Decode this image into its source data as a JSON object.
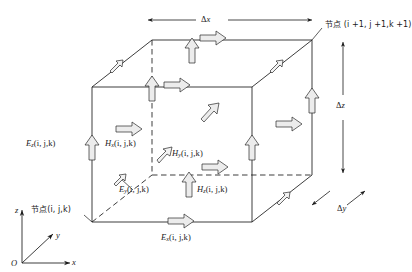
{
  "figure": {
    "name": "yee-cell-fdtd",
    "type": "diagram",
    "description_visible": false,
    "background_color": "#ffffff",
    "line_color": "#1a1a1a",
    "arrow_fill": "#e8e8e8"
  },
  "nodes": {
    "origin_label": "O",
    "near_node": "节点(i, j,k)",
    "far_node": "节点 (i +1, j +1,k +1)"
  },
  "axes": {
    "x_label": "x",
    "y_label": "y",
    "z_label": "z"
  },
  "dimensions": {
    "dx": {
      "delta": "Δ",
      "var": "x"
    },
    "dy": {
      "delta": "Δ",
      "var": "y"
    },
    "dz": {
      "delta": "Δ",
      "var": "z"
    }
  },
  "field_labels": {
    "Ez_left": {
      "sym": "E",
      "sub": "z",
      "args": "(i, j,k)"
    },
    "Hx": {
      "sym": "H",
      "sub": "x",
      "args": "(i, j,k)"
    },
    "Hy": {
      "sym": "H",
      "sub": "y",
      "args": "(i, j,k)"
    },
    "Ey": {
      "sym": "E",
      "sub": "y",
      "args": "(i, j,k)"
    },
    "Hz": {
      "sym": "H",
      "sub": "z",
      "args": "(i, j,k)"
    },
    "Ex_bottom": {
      "sym": "E",
      "sub": "x",
      "args": "(i, j,k)"
    }
  },
  "arrows": {
    "right_arrows_count": 7,
    "up_arrows_count": 5,
    "diagonal_arrows_count": 4
  }
}
